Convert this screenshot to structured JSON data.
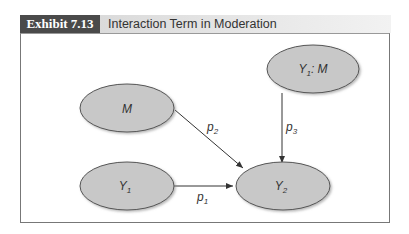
{
  "exhibit": {
    "badge": "Exhibit 7.13",
    "title": "Interaction Term in Moderation"
  },
  "diagram": {
    "nodes": [
      {
        "id": "M",
        "label": "M"
      },
      {
        "id": "Y1M",
        "label_main": "Y",
        "label_sub": "1",
        "label_rest": ": M"
      },
      {
        "id": "Y1",
        "label_main": "Y",
        "label_sub": "1"
      },
      {
        "id": "Y2",
        "label_main": "Y",
        "label_sub": "2"
      }
    ],
    "edges": [
      {
        "from": "Y1",
        "to": "Y2",
        "label_main": "p",
        "label_sub": "1"
      },
      {
        "from": "M",
        "to": "Y2",
        "label_main": "p",
        "label_sub": "2"
      },
      {
        "from": "Y1M",
        "to": "Y2",
        "label_main": "p",
        "label_sub": "3"
      }
    ],
    "colors": {
      "node_fill": "#c8c8c8",
      "node_stroke": "#555555",
      "edge": "#333333"
    }
  }
}
